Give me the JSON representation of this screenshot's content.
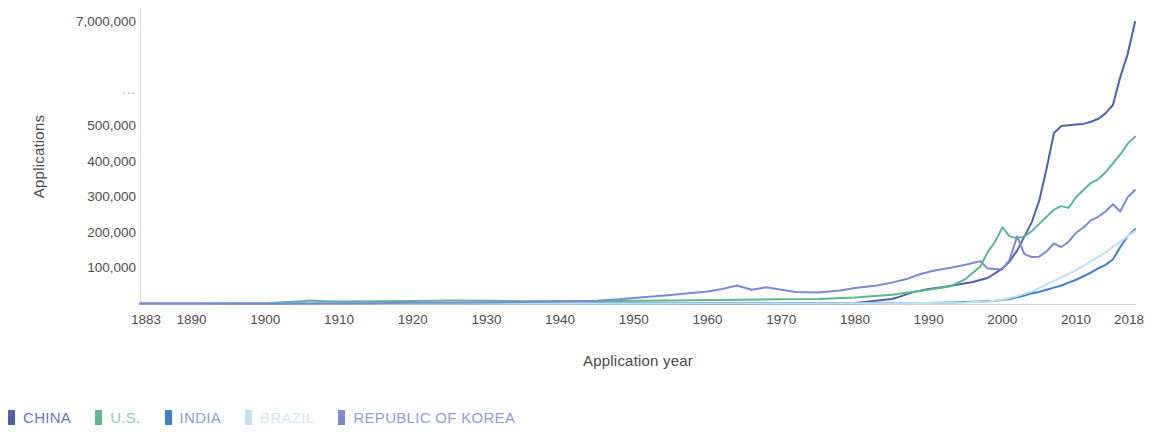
{
  "chart_data": {
    "type": "line",
    "title": "",
    "xlabel": "Application year",
    "ylabel": "Applications",
    "x_tick_labels": [
      "1883",
      "1890",
      "1900",
      "1910",
      "1920",
      "1930",
      "1940",
      "1950",
      "1960",
      "1970",
      "1980",
      "1990",
      "2000",
      "2010",
      "2018"
    ],
    "x_tick_values": [
      1883,
      1890,
      1900,
      1910,
      1920,
      1930,
      1940,
      1950,
      1960,
      1970,
      1980,
      1990,
      2000,
      2010,
      2018
    ],
    "xlim": [
      1883,
      2018
    ],
    "y_tick_labels": [
      "100,000",
      "200,000",
      "300,000",
      "400,000",
      "500,000",
      "...",
      "7,000,000"
    ],
    "y_tick_values": [
      100000,
      200000,
      300000,
      400000,
      500000,
      null,
      7000000
    ],
    "y_axis_break": true,
    "y_axis_break_label": "...",
    "ylim": [
      0,
      7000000
    ],
    "grid": false,
    "legend_position": "bottom-left",
    "series": [
      {
        "name": "CHINA",
        "color": "#4d5fb0",
        "x": [
          1883,
          1890,
          1900,
          1910,
          1920,
          1930,
          1940,
          1950,
          1960,
          1970,
          1975,
          1980,
          1985,
          1986,
          1988,
          1990,
          1992,
          1994,
          1996,
          1998,
          1999,
          2000,
          2001,
          2002,
          2003,
          2004,
          2005,
          2006,
          2007,
          2008,
          2009,
          2010,
          2011,
          2012,
          2013,
          2014,
          2015,
          2016,
          2017,
          2018
        ],
        "values": [
          500,
          500,
          600,
          700,
          800,
          900,
          1000,
          1200,
          1500,
          2000,
          2500,
          3000,
          14000,
          20000,
          34000,
          42000,
          48000,
          55000,
          62000,
          73000,
          86000,
          100000,
          120000,
          150000,
          190000,
          230000,
          290000,
          380000,
          480000,
          500000,
          510000,
          520000,
          530000,
          560000,
          600000,
          680000,
          800000,
          1200000,
          3600000,
          7000000
        ]
      },
      {
        "name": "U.S.",
        "color": "#58b98f",
        "x": [
          1883,
          1890,
          1900,
          1905,
          1906,
          1908,
          1910,
          1915,
          1920,
          1925,
          1930,
          1935,
          1940,
          1945,
          1950,
          1955,
          1960,
          1965,
          1970,
          1975,
          1980,
          1985,
          1990,
          1993,
          1995,
          1997,
          1998,
          1999,
          2000,
          2001,
          2002,
          2003,
          2004,
          2005,
          2006,
          2007,
          2008,
          2009,
          2010,
          2011,
          2012,
          2013,
          2014,
          2015,
          2016,
          2017,
          2018
        ],
        "values": [
          800,
          1000,
          2000,
          8000,
          9500,
          8000,
          7000,
          7500,
          8500,
          9500,
          9000,
          8000,
          8500,
          7000,
          9000,
          10000,
          11000,
          12000,
          13000,
          14000,
          18000,
          26000,
          40000,
          50000,
          70000,
          105000,
          145000,
          175000,
          215000,
          190000,
          185000,
          190000,
          205000,
          225000,
          245000,
          265000,
          275000,
          270000,
          300000,
          320000,
          340000,
          350000,
          370000,
          395000,
          420000,
          450000,
          470000
        ]
      },
      {
        "name": "INDIA",
        "color": "#3f7fd0",
        "x": [
          1883,
          1890,
          1900,
          1910,
          1920,
          1930,
          1940,
          1950,
          1960,
          1970,
          1980,
          1985,
          1990,
          1993,
          1995,
          1997,
          1999,
          2000,
          2001,
          2002,
          2003,
          2004,
          2005,
          2006,
          2007,
          2008,
          2009,
          2010,
          2011,
          2012,
          2013,
          2014,
          2015,
          2016,
          2017,
          2018
        ],
        "values": [
          400,
          400,
          500,
          600,
          700,
          800,
          900,
          1000,
          1300,
          1700,
          2200,
          2500,
          3000,
          4000,
          5500,
          7000,
          9000,
          11000,
          14000,
          19000,
          24000,
          30000,
          34000,
          40000,
          46000,
          52000,
          60000,
          68000,
          78000,
          88000,
          100000,
          110000,
          125000,
          160000,
          190000,
          210000
        ]
      },
      {
        "name": "BRAZIL",
        "color": "#bfe0f2",
        "x": [
          1883,
          1890,
          1900,
          1910,
          1920,
          1930,
          1940,
          1950,
          1960,
          1970,
          1980,
          1985,
          1990,
          1995,
          1998,
          2000,
          2002,
          2004,
          2006,
          2008,
          2010,
          2012,
          2014,
          2015,
          2016,
          2017,
          2018
        ],
        "values": [
          300,
          300,
          400,
          500,
          600,
          700,
          800,
          900,
          1200,
          1600,
          2000,
          2300,
          2800,
          4000,
          7000,
          12000,
          22000,
          35000,
          55000,
          75000,
          95000,
          120000,
          145000,
          160000,
          175000,
          190000,
          205000
        ]
      },
      {
        "name": "REPUBLIC OF KOREA",
        "color": "#7b8ad6",
        "x": [
          1883,
          1890,
          1900,
          1910,
          1915,
          1920,
          1925,
          1930,
          1935,
          1940,
          1945,
          1948,
          1950,
          1955,
          1960,
          1962,
          1964,
          1966,
          1968,
          1970,
          1972,
          1975,
          1978,
          1980,
          1983,
          1985,
          1987,
          1989,
          1991,
          1993,
          1995,
          1997,
          1998,
          1999,
          2000,
          2001,
          2002,
          2003,
          2004,
          2005,
          2006,
          2007,
          2008,
          2009,
          2010,
          2011,
          2012,
          2013,
          2014,
          2015,
          2016,
          2017,
          2018
        ],
        "values": [
          600,
          700,
          900,
          1200,
          2000,
          3500,
          3200,
          4000,
          5500,
          7000,
          9000,
          13000,
          17000,
          25000,
          35000,
          42000,
          52000,
          40000,
          47000,
          40000,
          34000,
          32000,
          38000,
          45000,
          52000,
          60000,
          70000,
          85000,
          95000,
          102000,
          110000,
          120000,
          100000,
          98000,
          97000,
          125000,
          190000,
          140000,
          132000,
          133000,
          148000,
          170000,
          160000,
          175000,
          200000,
          215000,
          235000,
          245000,
          260000,
          280000,
          260000,
          300000,
          320000
        ]
      }
    ]
  },
  "axes": {
    "y_title": "Applications",
    "x_title": "Application year"
  },
  "legend": {
    "items": [
      {
        "label": "CHINA",
        "color": "#4d5fb0",
        "text_color": "#5f79c7"
      },
      {
        "label": "U.S.",
        "color": "#58b98f",
        "text_color": "#86cfae"
      },
      {
        "label": "INDIA",
        "color": "#3f7fd0",
        "text_color": "#7fa7dd"
      },
      {
        "label": "BRAZIL",
        "color": "#bfe0f2",
        "text_color": "#cfe7f6"
      },
      {
        "label": "REPUBLIC OF KOREA",
        "color": "#7b8ad6",
        "text_color": "#8f9cd8"
      }
    ]
  }
}
